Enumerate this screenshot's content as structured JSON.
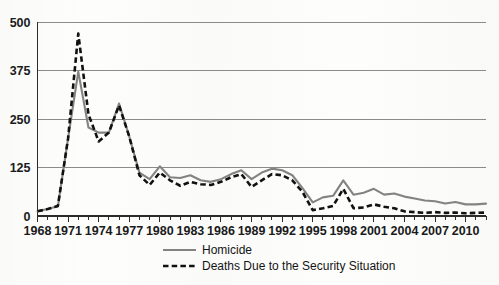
{
  "chart_data": {
    "type": "line",
    "title": "",
    "subtitle": "",
    "xlabel": "",
    "ylabel": "",
    "grid": true,
    "legend_position": "bottom-center",
    "ylim": [
      0,
      500
    ],
    "yticks": [
      0,
      125,
      250,
      375,
      500
    ],
    "xlim": [
      1968,
      2012
    ],
    "xtick_labels": [
      "1968",
      "1971",
      "1974",
      "1977",
      "1980",
      "1983",
      "1986",
      "1989",
      "1992",
      "1995",
      "1998",
      "2001",
      "2004",
      "2007",
      "2010"
    ],
    "xticks_all_years": [
      1968,
      1969,
      1970,
      1971,
      1972,
      1973,
      1974,
      1975,
      1976,
      1977,
      1978,
      1979,
      1980,
      1981,
      1982,
      1983,
      1984,
      1985,
      1986,
      1987,
      1988,
      1989,
      1990,
      1991,
      1992,
      1993,
      1994,
      1995,
      1996,
      1997,
      1998,
      1999,
      2000,
      2001,
      2002,
      2003,
      2004,
      2005,
      2006,
      2007,
      2008,
      2009,
      2010,
      2011,
      2012
    ],
    "x": [
      1968,
      1969,
      1970,
      1971,
      1972,
      1973,
      1974,
      1975,
      1976,
      1977,
      1978,
      1979,
      1980,
      1981,
      1982,
      1983,
      1984,
      1985,
      1986,
      1987,
      1988,
      1989,
      1990,
      1991,
      1992,
      1993,
      1994,
      1995,
      1996,
      1997,
      1998,
      1999,
      2000,
      2001,
      2002,
      2003,
      2004,
      2005,
      2006,
      2007,
      2008,
      2009,
      2010,
      2011,
      2012
    ],
    "series": [
      {
        "name": "Homicide",
        "style": "solid",
        "color": "#838383",
        "values": [
          12,
          18,
          25,
          200,
          372,
          228,
          215,
          215,
          290,
          205,
          112,
          95,
          128,
          100,
          98,
          105,
          92,
          88,
          95,
          108,
          118,
          95,
          112,
          122,
          118,
          105,
          72,
          35,
          48,
          52,
          92,
          55,
          60,
          70,
          55,
          58,
          50,
          45,
          40,
          38,
          32,
          36,
          30,
          30,
          32
        ]
      },
      {
        "name": "Deaths Due to the Security Situation",
        "style": "dashed",
        "color": "#111111",
        "values": [
          12,
          18,
          26,
          200,
          470,
          262,
          192,
          215,
          285,
          205,
          105,
          80,
          112,
          92,
          78,
          88,
          82,
          80,
          88,
          100,
          108,
          75,
          92,
          108,
          105,
          92,
          62,
          15,
          20,
          26,
          70,
          20,
          22,
          30,
          24,
          20,
          12,
          10,
          8,
          10,
          8,
          9,
          7,
          8,
          9
        ]
      }
    ],
    "legend": [
      {
        "label": "Homicide",
        "style": "solid",
        "color": "#838383"
      },
      {
        "label": "Deaths Due to the Security Situation",
        "style": "dashed",
        "color": "#111111"
      }
    ],
    "colors": {
      "gridline": "#8b8b8b",
      "axis": "#2b2b2b",
      "background": "#fdfdfc",
      "homicide": "#838383",
      "security": "#111111"
    }
  }
}
